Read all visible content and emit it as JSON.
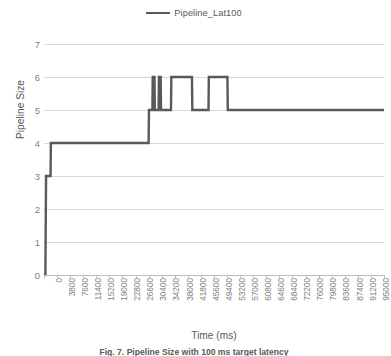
{
  "legend": {
    "entries": [
      {
        "label": "Pipeline_Lat100",
        "color": "#595959",
        "marker": "line-swatch"
      }
    ]
  },
  "axes": {
    "ylabel": "Pipeline Size",
    "xlabel": "Time (ms)",
    "yticks": [
      "7",
      "6",
      "5",
      "4",
      "3",
      "2",
      "1",
      "0"
    ],
    "ylim": [
      0,
      7
    ],
    "xticks": [
      "0",
      "3800",
      "7600",
      "11400",
      "15200",
      "19000",
      "22800",
      "26600",
      "30400",
      "34200",
      "38000",
      "41800",
      "45600",
      "49400",
      "53200",
      "57000",
      "60800",
      "64600",
      "68400",
      "72200",
      "76000",
      "79800",
      "83600",
      "87400",
      "91200",
      "95000"
    ],
    "xlim": [
      0,
      98800
    ],
    "grid": "horizontal"
  },
  "caption": {
    "text": "Fig. 7. Pipeline Size with 100 ms target latency"
  },
  "chart_data": {
    "type": "line",
    "title": "",
    "subtitle": "",
    "xlabel": "Time (ms)",
    "ylabel": "Pipeline Size",
    "xlim": [
      0,
      98800
    ],
    "ylim": [
      0,
      7
    ],
    "grid": true,
    "legend_position": "top-center",
    "categories": [
      "0",
      "3800",
      "7600",
      "11400",
      "15200",
      "19000",
      "22800",
      "26600",
      "30400",
      "34200",
      "38000",
      "41800",
      "45600",
      "49400",
      "53200",
      "57000",
      "60800",
      "64600",
      "68400",
      "72200",
      "76000",
      "79800",
      "83600",
      "87400",
      "91200",
      "95000"
    ],
    "series": [
      {
        "name": "Pipeline_Lat100",
        "color": "#595959",
        "style": "step",
        "points": [
          {
            "x": 0,
            "y": 0
          },
          {
            "x": 400,
            "y": 0
          },
          {
            "x": 600,
            "y": 3
          },
          {
            "x": 1900,
            "y": 3
          },
          {
            "x": 2000,
            "y": 4
          },
          {
            "x": 30400,
            "y": 4
          },
          {
            "x": 30500,
            "y": 5
          },
          {
            "x": 31500,
            "y": 5
          },
          {
            "x": 31600,
            "y": 6
          },
          {
            "x": 32100,
            "y": 6
          },
          {
            "x": 32200,
            "y": 5
          },
          {
            "x": 33300,
            "y": 5
          },
          {
            "x": 33400,
            "y": 6
          },
          {
            "x": 33900,
            "y": 6
          },
          {
            "x": 34000,
            "y": 5
          },
          {
            "x": 36900,
            "y": 5
          },
          {
            "x": 37000,
            "y": 6
          },
          {
            "x": 43000,
            "y": 6
          },
          {
            "x": 43100,
            "y": 5
          },
          {
            "x": 47800,
            "y": 5
          },
          {
            "x": 47900,
            "y": 6
          },
          {
            "x": 53300,
            "y": 6
          },
          {
            "x": 53400,
            "y": 5
          },
          {
            "x": 98800,
            "y": 5
          }
        ]
      }
    ]
  }
}
